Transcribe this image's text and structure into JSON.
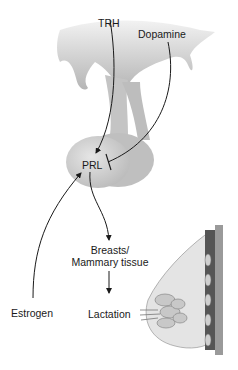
{
  "diagram": {
    "labels": {
      "trh": "TRH",
      "dopamine": "Dopamine",
      "prl": "PRL",
      "breasts_line1": "Breasts/",
      "breasts_line2": "Mammary tissue",
      "estrogen": "Estrogen",
      "lactation": "Lactation"
    },
    "relationships": [
      {
        "from": "TRH",
        "to": "PRL",
        "type": "stimulates"
      },
      {
        "from": "Dopamine",
        "to": "PRL",
        "type": "inhibits"
      },
      {
        "from": "Estrogen",
        "to": "PRL",
        "type": "stimulates"
      },
      {
        "from": "PRL",
        "to": "Breasts/Mammary tissue",
        "type": "stimulates"
      },
      {
        "from": "Breasts/Mammary tissue",
        "to": "Lactation",
        "type": "produces"
      }
    ],
    "colors": {
      "tissue_fill": "#d4d4d4",
      "tissue_shade": "#b0b0b0",
      "line": "#1a1a1a"
    }
  }
}
